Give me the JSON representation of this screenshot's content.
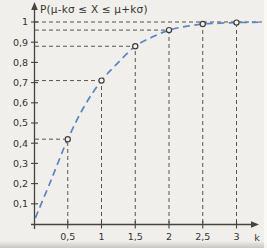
{
  "figure": {
    "background": "#f0efeb",
    "axis_color": "#45443f",
    "guide_color": "#55544e",
    "curve_color": "#5b84c0",
    "point_fill": "#f3f2ee",
    "point_stroke": "#3f3e3a",
    "text_color": "#35342f"
  },
  "chart_data": {
    "type": "line",
    "title": "P(μ-kσ ≤ X ≤ μ+kσ)",
    "xlabel": "k",
    "ylabel": "",
    "x": [
      0.5,
      1,
      1.5,
      2,
      2.5,
      3
    ],
    "values": [
      0.42,
      0.71,
      0.88,
      0.96,
      0.99,
      0.997
    ],
    "x_tick_labels": [
      "0,5",
      "1",
      "1,5",
      "2",
      "2,5",
      "3"
    ],
    "y_tick_values": [
      0.1,
      0.2,
      0.3,
      0.4,
      0.5,
      0.6,
      0.7,
      0.8,
      0.9,
      1
    ],
    "y_tick_labels": [
      "0,1",
      "0,2",
      "0,3",
      "0,4",
      "0,5",
      "0,6",
      "0,7",
      "0,8",
      "0,9",
      "1"
    ],
    "asymptote": 1,
    "xlim": [
      0,
      3.4
    ],
    "ylim": [
      0,
      1.08
    ],
    "line_style": "dashed",
    "marker": "open-circle",
    "grid": "dashed-guides-to-points",
    "legend": null,
    "curve": [
      [
        0.02,
        0.03
      ],
      [
        0.25,
        0.215
      ],
      [
        0.5,
        0.42
      ],
      [
        0.75,
        0.585
      ],
      [
        1,
        0.71
      ],
      [
        1.25,
        0.8
      ],
      [
        1.5,
        0.88
      ],
      [
        1.75,
        0.925
      ],
      [
        2,
        0.96
      ],
      [
        2.25,
        0.978
      ],
      [
        2.5,
        0.99
      ],
      [
        2.75,
        0.994
      ],
      [
        3,
        0.997
      ],
      [
        3.38,
        0.999
      ]
    ]
  }
}
